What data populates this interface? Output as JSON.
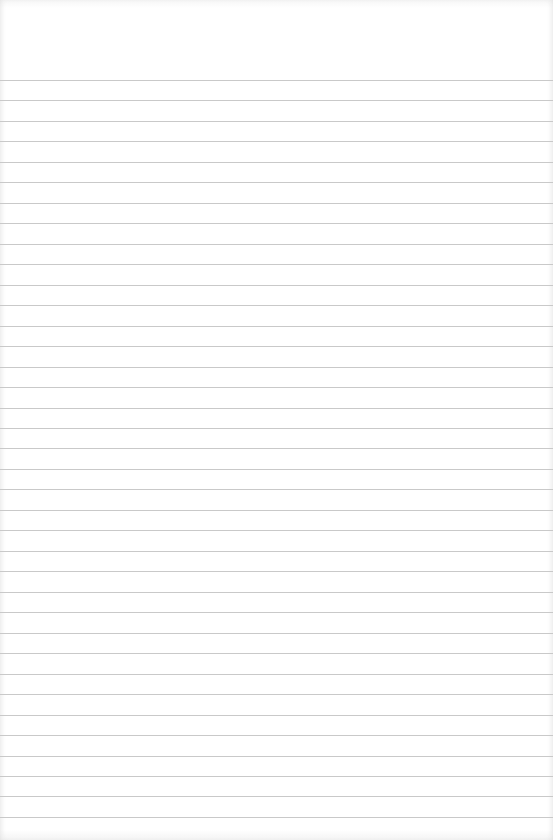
{
  "page": {
    "type": "blank lined paper",
    "background_color": "#ffffff",
    "line_color": "#c9c9c9",
    "line_count": 37,
    "first_line_y": 80,
    "line_spacing": 20.47,
    "text_content": []
  }
}
